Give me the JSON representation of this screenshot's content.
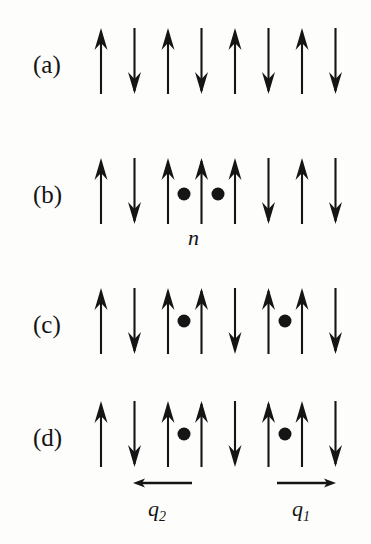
{
  "figure": {
    "ink_color": "#151515",
    "background_color": "#fdfdfc",
    "geometry": {
      "first_arrow_x": 101,
      "arrow_spacing": 33.5,
      "arrow_length": 66,
      "arrow_head_width": 13,
      "arrow_head_height": 22,
      "dot_radius": 6.5
    },
    "rows": [
      {
        "id": "row-a",
        "label": "(a)",
        "label_x": 33,
        "label_y": 70,
        "arrows_top_y": 28,
        "spins": [
          "up",
          "down",
          "up",
          "down",
          "up",
          "down",
          "up",
          "down"
        ],
        "dots": [],
        "sub_labels": []
      },
      {
        "id": "row-b",
        "label": "(b)",
        "label_x": 33,
        "label_y": 200,
        "arrows_top_y": 158,
        "spins": [
          "up",
          "down",
          "up",
          "up",
          "up",
          "down",
          "up",
          "down"
        ],
        "dots": [
          {
            "x": 184,
            "y": 194
          },
          {
            "x": 218,
            "y": 194
          }
        ],
        "sub_labels": [
          {
            "name": "n",
            "text": "n",
            "x": 196,
            "y": 247
          }
        ]
      },
      {
        "id": "row-c",
        "label": "(c)",
        "label_x": 33,
        "label_y": 330,
        "arrows_top_y": 288,
        "spins": [
          "up",
          "down",
          "up",
          "up",
          "down",
          "up",
          "up",
          "down"
        ],
        "dots": [
          {
            "x": 184,
            "y": 321
          },
          {
            "x": 285,
            "y": 321
          }
        ],
        "sub_labels": []
      },
      {
        "id": "row-d",
        "label": "(d)",
        "label_x": 33,
        "label_y": 443,
        "arrows_top_y": 401,
        "spins": [
          "up",
          "down",
          "up",
          "up",
          "down",
          "up",
          "up",
          "down"
        ],
        "dots": [
          {
            "x": 184,
            "y": 434
          },
          {
            "x": 285,
            "y": 434
          }
        ],
        "sub_labels": []
      }
    ],
    "measure_arrows": [
      {
        "id": "q2",
        "label": "q",
        "subscript": "2",
        "direction": "left",
        "x_start": 133,
        "x_end": 192,
        "y": 483,
        "label_x": 148,
        "label_y": 518
      },
      {
        "id": "q1",
        "label": "q",
        "subscript": "1",
        "direction": "right",
        "x_start": 277,
        "x_end": 336,
        "y": 483,
        "label_x": 292,
        "label_y": 518
      }
    ]
  }
}
